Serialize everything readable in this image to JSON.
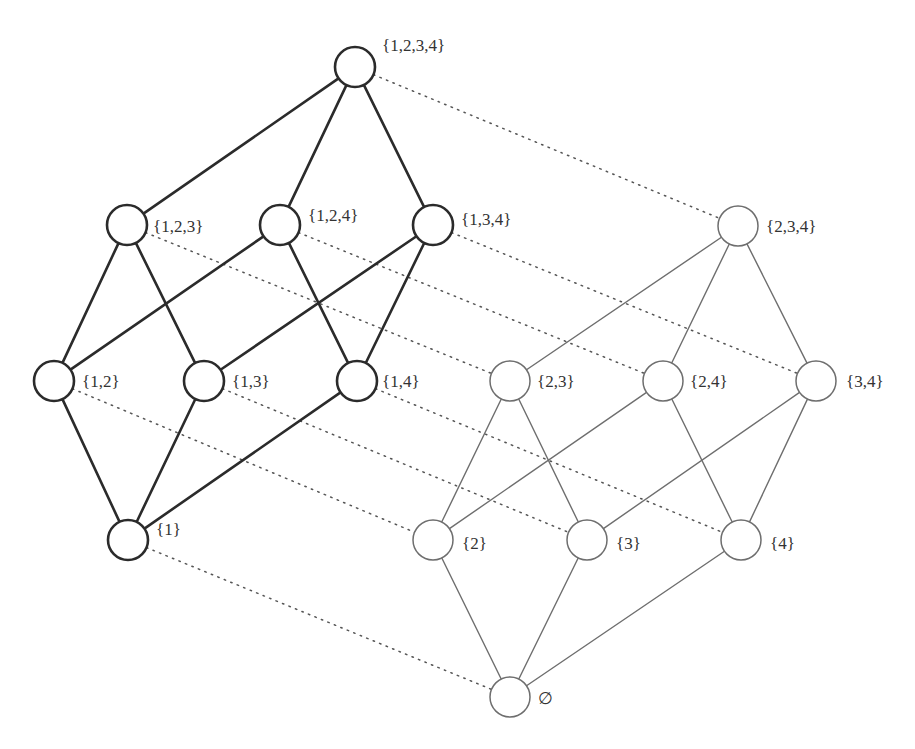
{
  "diagram": {
    "empty_set_symbol": "∅",
    "colors": {
      "bold_stroke": "#2b2b2b",
      "thin_stroke": "#6e6e6e",
      "dotted_stroke": "#555555",
      "label_text": "#333333",
      "background": "#ffffff"
    },
    "nodes": [
      {
        "id": "1234",
        "label": "{1,2,3,4}",
        "group": "contains-1"
      },
      {
        "id": "123",
        "label": "{1,2,3}",
        "group": "contains-1"
      },
      {
        "id": "124",
        "label": "{1,2,4}",
        "group": "contains-1"
      },
      {
        "id": "134",
        "label": "{1,3,4}",
        "group": "contains-1"
      },
      {
        "id": "12",
        "label": "{1,2}",
        "group": "contains-1"
      },
      {
        "id": "13",
        "label": "{1,3}",
        "group": "contains-1"
      },
      {
        "id": "14",
        "label": "{1,4}",
        "group": "contains-1"
      },
      {
        "id": "1",
        "label": "{1}",
        "group": "contains-1"
      },
      {
        "id": "234",
        "label": "{2,3,4}",
        "group": "excludes-1"
      },
      {
        "id": "23",
        "label": "{2,3}",
        "group": "excludes-1"
      },
      {
        "id": "24",
        "label": "{2,4}",
        "group": "excludes-1"
      },
      {
        "id": "34",
        "label": "{3,4}",
        "group": "excludes-1"
      },
      {
        "id": "2",
        "label": "{2}",
        "group": "excludes-1"
      },
      {
        "id": "3",
        "label": "{3}",
        "group": "excludes-1"
      },
      {
        "id": "4",
        "label": "{4}",
        "group": "excludes-1"
      },
      {
        "id": "0",
        "label": "∅",
        "group": "excludes-1"
      }
    ],
    "edges_bold": [
      [
        "1234",
        "123"
      ],
      [
        "1234",
        "124"
      ],
      [
        "1234",
        "134"
      ],
      [
        "123",
        "12"
      ],
      [
        "123",
        "13"
      ],
      [
        "124",
        "12"
      ],
      [
        "124",
        "14"
      ],
      [
        "134",
        "13"
      ],
      [
        "134",
        "14"
      ],
      [
        "12",
        "1"
      ],
      [
        "13",
        "1"
      ],
      [
        "14",
        "1"
      ]
    ],
    "edges_thin": [
      [
        "234",
        "23"
      ],
      [
        "234",
        "24"
      ],
      [
        "234",
        "34"
      ],
      [
        "23",
        "2"
      ],
      [
        "23",
        "3"
      ],
      [
        "24",
        "2"
      ],
      [
        "24",
        "4"
      ],
      [
        "34",
        "3"
      ],
      [
        "34",
        "4"
      ],
      [
        "2",
        "0"
      ],
      [
        "3",
        "0"
      ],
      [
        "4",
        "0"
      ]
    ],
    "edges_dotted": [
      [
        "1234",
        "234"
      ],
      [
        "123",
        "23"
      ],
      [
        "124",
        "24"
      ],
      [
        "134",
        "34"
      ],
      [
        "12",
        "2"
      ],
      [
        "13",
        "3"
      ],
      [
        "14",
        "4"
      ],
      [
        "1",
        "0"
      ]
    ]
  }
}
